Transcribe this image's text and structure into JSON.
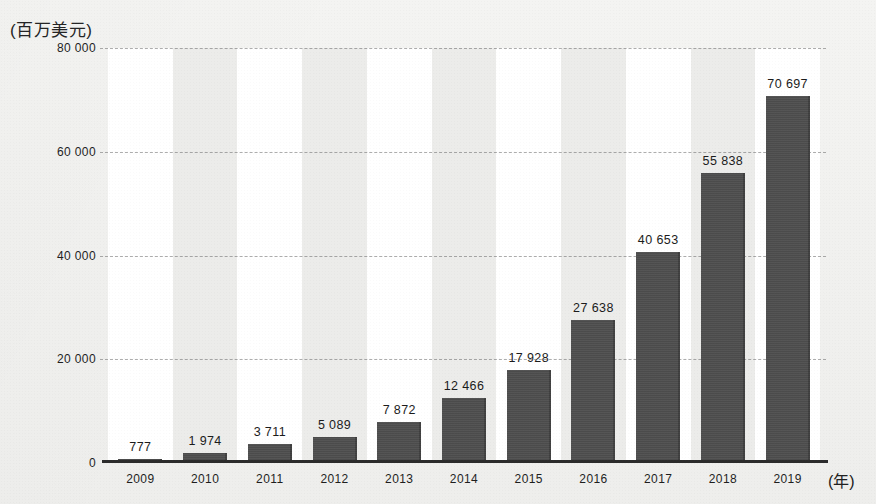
{
  "axis": {
    "y_unit_label": "(百万美元)",
    "x_unit_label": "(年)",
    "y_ticks": [
      "0",
      "20 000",
      "40 000",
      "60 000",
      "80 000"
    ]
  },
  "chart_data": {
    "type": "bar",
    "title": "",
    "subtitle": "",
    "xlabel": "(年)",
    "ylabel": "(百万美元)",
    "categories": [
      "2009",
      "2010",
      "2011",
      "2012",
      "2013",
      "2014",
      "2015",
      "2016",
      "2017",
      "2018",
      "2019"
    ],
    "values": [
      777,
      1974,
      3711,
      5089,
      7872,
      12466,
      17928,
      27638,
      40653,
      55838,
      70697
    ],
    "value_labels": [
      "777",
      "1 974",
      "3 711",
      "5 089",
      "7 872",
      "12 466",
      "17 928",
      "27 638",
      "40 653",
      "55 838",
      "70 697"
    ],
    "ylim": [
      0,
      80000
    ],
    "ytick_values": [
      0,
      20000,
      40000,
      60000,
      80000
    ],
    "ytick_labels": [
      "0",
      "20 000",
      "40 000",
      "60 000",
      "80 000"
    ],
    "grid": true,
    "grid_axis": "y",
    "grid_style": "dashed",
    "legend": false,
    "bar_color": "#4d4d4d",
    "band_color_a": "#ffffff",
    "band_color_b": "#ececea",
    "background_color": "#f1f1ef"
  }
}
